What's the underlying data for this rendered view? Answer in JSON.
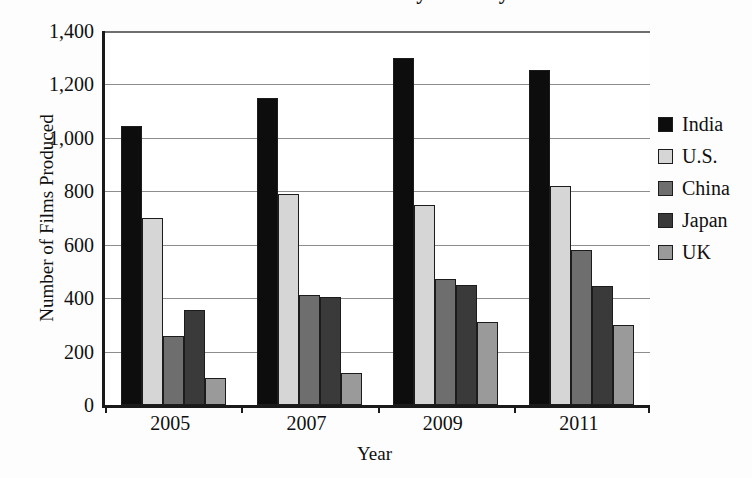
{
  "chart_data": {
    "type": "bar",
    "title": "Number of Films Produced by Country",
    "xlabel": "Year",
    "ylabel": "Number of Films Produced",
    "categories": [
      "2005",
      "2007",
      "2009",
      "2011"
    ],
    "ylim": [
      0,
      1400
    ],
    "ytick_values": [
      0,
      200,
      400,
      600,
      800,
      1000,
      1200,
      1400
    ],
    "ytick_labels": [
      "0",
      "200",
      "400",
      "600",
      "800",
      "1,000",
      "1,200",
      "1,400"
    ],
    "grid": true,
    "legend_position": "right",
    "series": [
      {
        "name": "India",
        "color": "#0d0d0d",
        "values": [
          1045,
          1150,
          1300,
          1255
        ]
      },
      {
        "name": "U.S.",
        "color": "#d6d6d6",
        "values": [
          700,
          790,
          750,
          820
        ]
      },
      {
        "name": "China",
        "color": "#6e6e6e",
        "values": [
          260,
          410,
          470,
          580
        ]
      },
      {
        "name": "Japan",
        "color": "#3a3a3a",
        "values": [
          355,
          405,
          450,
          445
        ]
      },
      {
        "name": "UK",
        "color": "#9a9a9a",
        "values": [
          100,
          120,
          310,
          300
        ]
      }
    ]
  },
  "legend": {
    "items": [
      {
        "label": "India",
        "swatch": "legend-swatch-india"
      },
      {
        "label": "U.S.",
        "swatch": "legend-swatch-us"
      },
      {
        "label": "China",
        "swatch": "legend-swatch-china"
      },
      {
        "label": "Japan",
        "swatch": "legend-swatch-japan"
      },
      {
        "label": "UK",
        "swatch": "legend-swatch-uk"
      }
    ]
  },
  "colors": {
    "india": "#0d0d0d",
    "us": "#d6d6d6",
    "china": "#6e6e6e",
    "japan": "#3a3a3a",
    "uk": "#9a9a9a",
    "axis": "#1a1a1a",
    "gridline": "#8d8d8d",
    "background": "#ffffff"
  }
}
